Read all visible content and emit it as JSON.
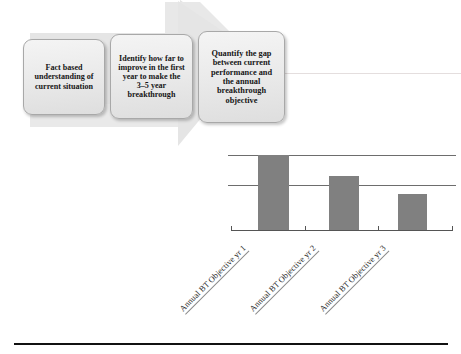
{
  "slide": {
    "title": "Breakthrough objective process with annual BT objective bar chart"
  },
  "process": {
    "steps": [
      {
        "id": "step-1",
        "label": "Fact based\nunderstanding of\ncurrent situation"
      },
      {
        "id": "step-2",
        "label": "Identify how far to\nimprove in the first\nyear to make the\n3–5 year\nbreakthrough"
      },
      {
        "id": "step-3",
        "label": "Quantify the gap\nbetween current\nperformance and\nthe annual\nbreakthrough\nobjective"
      }
    ]
  },
  "arrow": {
    "name": "process-arrow",
    "direction": "right",
    "fill": "#e6e6e6"
  },
  "chart_data": {
    "type": "bar",
    "title": "",
    "xlabel": "",
    "ylabel": "",
    "categories": [
      "Annual BT Objective yr 1",
      "Annual BT Objective yr 2",
      "Annual BT Objective yr 3"
    ],
    "values": [
      3,
      2.15,
      1.45
    ],
    "ylim": [
      0,
      3.2
    ],
    "gridlines": [
      3,
      1.8
    ],
    "grid": true,
    "legend": false,
    "legend_position": "none",
    "bar_color": "#808080",
    "axis_color": "#555555",
    "gridline_color": "#6d6d6d",
    "tick_label_rotation": -45
  },
  "colors": {
    "box_border": "#a8a8a8",
    "box_fill": "#ebebeb",
    "bar": "#808080",
    "rule": "#111111"
  }
}
